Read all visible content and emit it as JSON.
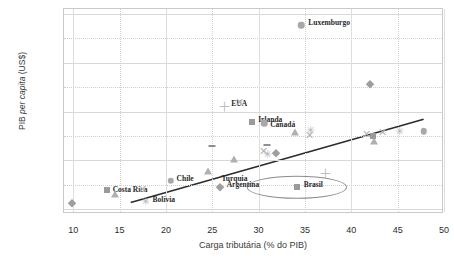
{
  "chart_data": {
    "type": "scatter",
    "title": "",
    "xlabel": "Carga tributária (% do PIB)",
    "ylabel": "PIB per capita (US$)",
    "ylabel_plain": "PIB ",
    "ylabel_italic": "per capita",
    "ylabel_suffix": " (US$)",
    "xlim": [
      9,
      50
    ],
    "ylim": [
      8000,
      92000
    ],
    "xticks": [
      "10",
      "15",
      "20",
      "25",
      "30",
      "35",
      "40",
      "45",
      "50"
    ],
    "xtick_values": [
      10,
      15,
      20,
      25,
      30,
      35,
      40,
      45,
      50
    ],
    "yticks": [
      "10000",
      "20000",
      "30000",
      "40000",
      "50000",
      "60000",
      "70000",
      "80000",
      "90000"
    ],
    "ytick_values": [
      10000,
      20000,
      30000,
      40000,
      50000,
      60000,
      70000,
      80000,
      90000
    ],
    "grid": "both",
    "legend": "none",
    "trendline": {
      "x0": 16.2,
      "y0": 12700,
      "x1": 47.8,
      "y1": 46800
    },
    "highlight": {
      "label": "Brasil",
      "x": 34.1,
      "y": 19000,
      "rx": 5.3,
      "ry": 4200
    },
    "points": [
      {
        "label": "Luxemburgo",
        "x": 34.6,
        "y": 85300,
        "marker": "circle",
        "label_dx": 7,
        "label_dy": -3
      },
      {
        "label": "EUA",
        "x": 26.3,
        "y": 52200,
        "marker": "plus",
        "label_dx": 7,
        "label_dy": -3
      },
      {
        "label": "Irlanda",
        "x": 29.3,
        "y": 45700,
        "marker": "square",
        "label_dx": 6,
        "label_dy": -3
      },
      {
        "label": "Canadá",
        "x": 30.6,
        "y": 45100,
        "marker": "circle",
        "label_dx": 6,
        "label_dy": 1
      },
      {
        "label": "Chile",
        "x": 20.5,
        "y": 21700,
        "marker": "circle",
        "label_dx": 6,
        "label_dy": -3
      },
      {
        "label": "Costa Rica",
        "x": 13.6,
        "y": 17800,
        "marker": "square",
        "label_dx": 6,
        "label_dy": -1
      },
      {
        "label": "Bolívia",
        "x": 17.8,
        "y": 13200,
        "marker": "star",
        "label_dx": 7,
        "label_dy": -2
      },
      {
        "label": "Turquia",
        "x": 26.0,
        "y": 22600,
        "marker": "none",
        "label_dx": 0,
        "label_dy": 0
      },
      {
        "label": "Argentina",
        "x": 25.8,
        "y": 19100,
        "marker": "diamond",
        "label_dx": 7,
        "label_dy": -3
      },
      {
        "label": "Brasil",
        "x": 34.1,
        "y": 19000,
        "marker": "square",
        "label_dx": 7,
        "label_dy": -3
      },
      {
        "label": "",
        "x": 9.9,
        "y": 12500,
        "marker": "diamond",
        "label_dx": 0,
        "label_dy": 0
      },
      {
        "label": "",
        "x": 14.5,
        "y": 16300,
        "marker": "triangle",
        "label_dx": 0,
        "label_dy": 0
      },
      {
        "label": "",
        "x": 17.5,
        "y": 18300,
        "marker": "x",
        "label_dx": 0,
        "label_dy": 0
      },
      {
        "label": "",
        "x": 25.0,
        "y": 35900,
        "marker": "dash",
        "label_dx": 0,
        "label_dy": 0
      },
      {
        "label": "",
        "x": 27.9,
        "y": 53900,
        "marker": "x",
        "label_dx": 0,
        "label_dy": 0
      },
      {
        "label": "",
        "x": 24.5,
        "y": 25600,
        "marker": "triangle",
        "label_dx": 0,
        "label_dy": 0
      },
      {
        "label": "",
        "x": 27.3,
        "y": 30700,
        "marker": "triangle",
        "label_dx": 0,
        "label_dy": 0
      },
      {
        "label": "",
        "x": 30.9,
        "y": 36300,
        "marker": "dash",
        "label_dx": 0,
        "label_dy": 0
      },
      {
        "label": "",
        "x": 30.5,
        "y": 33800,
        "marker": "x",
        "label_dx": 0,
        "label_dy": 0
      },
      {
        "label": "",
        "x": 31.0,
        "y": 32600,
        "marker": "star",
        "label_dx": 0,
        "label_dy": 0
      },
      {
        "label": "",
        "x": 31.9,
        "y": 33200,
        "marker": "diamond",
        "label_dx": 0,
        "label_dy": 0
      },
      {
        "label": "",
        "x": 33.9,
        "y": 41400,
        "marker": "triangle",
        "label_dx": 0,
        "label_dy": 0
      },
      {
        "label": "",
        "x": 35.6,
        "y": 42500,
        "marker": "star",
        "label_dx": 0,
        "label_dy": 0
      },
      {
        "label": "",
        "x": 35.5,
        "y": 40300,
        "marker": "x",
        "label_dx": 0,
        "label_dy": 0
      },
      {
        "label": "",
        "x": 37.2,
        "y": 25000,
        "marker": "plus",
        "label_dx": 0,
        "label_dy": 0
      },
      {
        "label": "",
        "x": 42.0,
        "y": 61400,
        "marker": "diamond",
        "label_dx": 0,
        "label_dy": 0
      },
      {
        "label": "",
        "x": 41.6,
        "y": 40900,
        "marker": "x",
        "label_dx": 0,
        "label_dy": 0
      },
      {
        "label": "",
        "x": 42.3,
        "y": 39800,
        "marker": "square",
        "label_dx": 0,
        "label_dy": 0
      },
      {
        "label": "",
        "x": 42.4,
        "y": 38100,
        "marker": "triangle",
        "label_dx": 0,
        "label_dy": 0
      },
      {
        "label": "",
        "x": 43.4,
        "y": 41600,
        "marker": "x",
        "label_dx": 0,
        "label_dy": 0
      },
      {
        "label": "",
        "x": 45.2,
        "y": 42100,
        "marker": "star",
        "label_dx": 0,
        "label_dy": 0
      },
      {
        "label": "",
        "x": 47.8,
        "y": 42000,
        "marker": "circle",
        "label_dx": 0,
        "label_dy": 0
      }
    ]
  }
}
